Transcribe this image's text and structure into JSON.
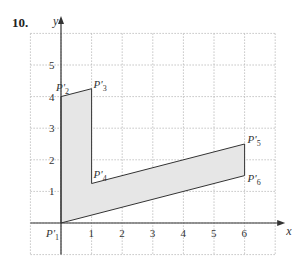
{
  "problem_number": "10.",
  "chart_data": {
    "type": "line",
    "title": "",
    "xlabel": "x",
    "ylabel": "y",
    "xlim": [
      -1,
      7
    ],
    "ylim": [
      -1,
      6
    ],
    "grid": true,
    "x_ticks": [
      "1",
      "2",
      "3",
      "4",
      "5",
      "6"
    ],
    "y_ticks": [
      "1",
      "2",
      "3",
      "4",
      "5"
    ],
    "polygon": {
      "fill": "#e6e6e6",
      "points": [
        {
          "label": "P'1",
          "x": 0,
          "y": 0
        },
        {
          "label": "P'2",
          "x": 0,
          "y": 4
        },
        {
          "label": "P'3",
          "x": 1,
          "y": 4.25
        },
        {
          "label": "P'4",
          "x": 1,
          "y": 1.25
        },
        {
          "label": "P'5",
          "x": 6,
          "y": 2.5
        },
        {
          "label": "P'6",
          "x": 6,
          "y": 1.5
        }
      ]
    }
  }
}
